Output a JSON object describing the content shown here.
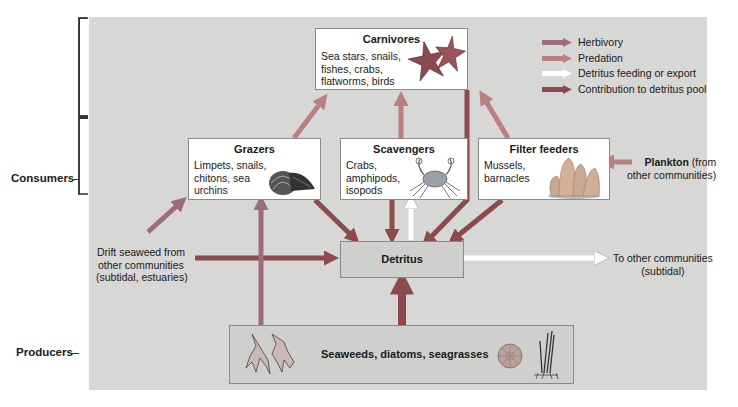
{
  "colors": {
    "herbivory": "#9c6c7c",
    "predation": "#b98080",
    "detritus_feeding": "#ffffff",
    "contribution": "#8c4a4c",
    "panel": "#d7d7d5"
  },
  "side_labels": {
    "consumers": "Consumers",
    "producers": "Producers"
  },
  "nodes": {
    "carnivores": {
      "title": "Carnivores",
      "desc": [
        "Sea stars, snails,",
        "fishes, crabs,",
        "flatworms, birds"
      ],
      "icon": "sea-star-icon"
    },
    "grazers": {
      "title": "Grazers",
      "desc": [
        "Limpets, snails,",
        "chitons, sea",
        "urchins"
      ],
      "icon": "chiton-shell-icon"
    },
    "scavengers": {
      "title": "Scavengers",
      "desc": [
        "Crabs,",
        "amphipods,",
        "isopods"
      ],
      "icon": "crab-icon"
    },
    "filter_feeders": {
      "title": "Filter feeders",
      "desc": [
        "Mussels,",
        "barnacles"
      ],
      "icon": "barnacle-icon"
    },
    "detritus": {
      "title": "Detritus"
    },
    "producers": {
      "title": "Seaweeds, diatoms, seagrasses",
      "icons": [
        "seaweed-icon",
        "diatom-icon",
        "seagrass-icon"
      ]
    }
  },
  "external": {
    "drift_seaweed": [
      "Drift seaweed from",
      "other communities",
      "(subtidal, estuaries)"
    ],
    "plankton_bold": "Plankton",
    "plankton_rest": " (from",
    "plankton_line2": "other communities)",
    "export": [
      "To other communities",
      "(subtidal)"
    ]
  },
  "legend": [
    {
      "label": "Herbivory",
      "type": "herbivory"
    },
    {
      "label": "Predation",
      "type": "predation"
    },
    {
      "label": "Detritus feeding or export",
      "type": "detritus_feeding"
    },
    {
      "label": "Contribution to detritus pool",
      "type": "contribution"
    }
  ]
}
